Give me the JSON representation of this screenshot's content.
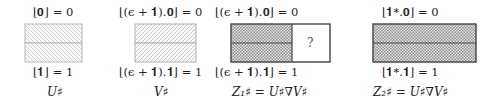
{
  "panels": [
    {
      "id": "U",
      "top_label": "⌊𝟎⌋ = 0",
      "bottom_label": "⌊𝟏⌋ = 1",
      "caption": "U♯",
      "pattern": "light-hatch-down",
      "cells": [
        "row-0",
        "row-1"
      ],
      "unknown_cell": null
    },
    {
      "id": "V",
      "top_label": "⌊(ϵ + 𝟏).𝟎⌋ = 0",
      "bottom_label": "⌊(ϵ + 𝟏).𝟏⌋ = 1",
      "caption": "V♯",
      "pattern": "light-hatch-up",
      "cells": [
        "row-0",
        "row-1"
      ],
      "unknown_cell": null
    },
    {
      "id": "Z1",
      "top_label": "⌊(ϵ + 𝟏).𝟎⌋ = 0",
      "bottom_label": "⌊(ϵ + 𝟏).𝟏⌋ = 1",
      "caption": "Z₁♯ = U♯∇V♯",
      "pattern": "crosshatch",
      "cells": [
        "row-0",
        "row-1"
      ],
      "unknown_cell": "?"
    },
    {
      "id": "Z2",
      "top_label": "⌊𝟏*.𝟎⌋ = 0",
      "bottom_label": "⌊𝟏*.𝟏⌋ = 1",
      "caption": "Z₂♯ = U♯∇V♯",
      "pattern": "crosshatch",
      "cells": [
        "row-0",
        "row-1"
      ],
      "unknown_cell": null
    }
  ],
  "colors": {
    "light_border": "#b5b5b5",
    "dark_border": "#555555",
    "hatch": "#c8c8c8",
    "crosshatch": "#8a8a8a"
  }
}
